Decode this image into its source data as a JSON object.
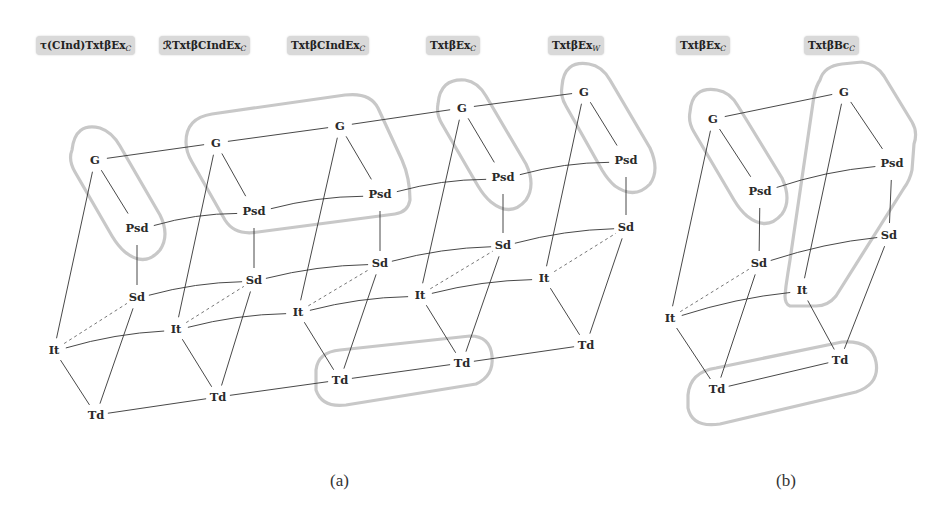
{
  "figure": {
    "column_labels_a": [
      {
        "main": "τ(CInd)TxtβEx",
        "sub": "C",
        "x": 36,
        "y": 36
      },
      {
        "main": "ℛTxtβCIndEx",
        "sub": "C",
        "x": 159,
        "y": 36
      },
      {
        "main": "TxtβCIndEx",
        "sub": "C",
        "x": 287,
        "y": 36
      },
      {
        "main": "TxtβEx",
        "sub": "C",
        "x": 426,
        "y": 36
      },
      {
        "main": "TxtβEx",
        "sub": "W",
        "x": 548,
        "y": 36
      }
    ],
    "column_labels_b": [
      {
        "main": "TxtβEx",
        "sub": "C",
        "x": 676,
        "y": 36
      },
      {
        "main": "TxtβBc",
        "sub": "C",
        "x": 804,
        "y": 36
      }
    ],
    "subfigure_labels": [
      {
        "text": "(a)",
        "x": 330,
        "y": 471
      },
      {
        "text": "(b)",
        "x": 776,
        "y": 471
      }
    ]
  },
  "diagram": {
    "node_label_names": [
      "G",
      "Psd",
      "Sd",
      "It",
      "Td"
    ],
    "nodes": [
      {
        "id": "a1G",
        "label": "G",
        "x": 95,
        "y": 160
      },
      {
        "id": "a1P",
        "label": "Psd",
        "x": 137,
        "y": 228
      },
      {
        "id": "a1S",
        "label": "Sd",
        "x": 137,
        "y": 297
      },
      {
        "id": "a1I",
        "label": "It",
        "x": 54,
        "y": 350
      },
      {
        "id": "a1T",
        "label": "Td",
        "x": 96,
        "y": 415
      },
      {
        "id": "a2G",
        "label": "G",
        "x": 216,
        "y": 143
      },
      {
        "id": "a2P",
        "label": "Psd",
        "x": 254,
        "y": 211
      },
      {
        "id": "a2S",
        "label": "Sd",
        "x": 254,
        "y": 280
      },
      {
        "id": "a2I",
        "label": "It",
        "x": 176,
        "y": 329
      },
      {
        "id": "a2T",
        "label": "Td",
        "x": 218,
        "y": 397
      },
      {
        "id": "a3G",
        "label": "G",
        "x": 340,
        "y": 126
      },
      {
        "id": "a3P",
        "label": "Psd",
        "x": 380,
        "y": 194
      },
      {
        "id": "a3S",
        "label": "Sd",
        "x": 380,
        "y": 263
      },
      {
        "id": "a3I",
        "label": "It",
        "x": 298,
        "y": 312
      },
      {
        "id": "a3T",
        "label": "Td",
        "x": 340,
        "y": 380
      },
      {
        "id": "a4G",
        "label": "G",
        "x": 462,
        "y": 108
      },
      {
        "id": "a4P",
        "label": "Psd",
        "x": 503,
        "y": 177
      },
      {
        "id": "a4S",
        "label": "Sd",
        "x": 503,
        "y": 245
      },
      {
        "id": "a4I",
        "label": "It",
        "x": 420,
        "y": 295
      },
      {
        "id": "a4T",
        "label": "Td",
        "x": 462,
        "y": 363
      },
      {
        "id": "a5G",
        "label": "G",
        "x": 584,
        "y": 92
      },
      {
        "id": "a5P",
        "label": "Psd",
        "x": 626,
        "y": 160
      },
      {
        "id": "a5S",
        "label": "Sd",
        "x": 626,
        "y": 227
      },
      {
        "id": "a5I",
        "label": "It",
        "x": 544,
        "y": 278
      },
      {
        "id": "a5T",
        "label": "Td",
        "x": 586,
        "y": 345
      },
      {
        "id": "b1G",
        "label": "G",
        "x": 713,
        "y": 119
      },
      {
        "id": "b1P",
        "label": "Psd",
        "x": 760,
        "y": 191
      },
      {
        "id": "b1S",
        "label": "Sd",
        "x": 759,
        "y": 263
      },
      {
        "id": "b1I",
        "label": "It",
        "x": 670,
        "y": 318
      },
      {
        "id": "b1T",
        "label": "Td",
        "x": 717,
        "y": 389
      },
      {
        "id": "b2G",
        "label": "G",
        "x": 844,
        "y": 92
      },
      {
        "id": "b2P",
        "label": "Psd",
        "x": 892,
        "y": 163
      },
      {
        "id": "b2S",
        "label": "Sd",
        "x": 889,
        "y": 235
      },
      {
        "id": "b2I",
        "label": "It",
        "x": 802,
        "y": 290
      },
      {
        "id": "b2T",
        "label": "Td",
        "x": 840,
        "y": 360
      }
    ],
    "edges_solid": [
      [
        "a1G",
        "a1P"
      ],
      [
        "a1P",
        "a1S"
      ],
      [
        "a1G",
        "a1I"
      ],
      [
        "a1I",
        "a1T"
      ],
      [
        "a1S",
        "a1T"
      ],
      [
        "a2G",
        "a2P"
      ],
      [
        "a2P",
        "a2S"
      ],
      [
        "a2G",
        "a2I"
      ],
      [
        "a2I",
        "a2T"
      ],
      [
        "a2S",
        "a2T"
      ],
      [
        "a3G",
        "a3P"
      ],
      [
        "a3P",
        "a3S"
      ],
      [
        "a3G",
        "a3I"
      ],
      [
        "a3I",
        "a3T"
      ],
      [
        "a3S",
        "a3T"
      ],
      [
        "a4G",
        "a4P"
      ],
      [
        "a4P",
        "a4S"
      ],
      [
        "a4G",
        "a4I"
      ],
      [
        "a4I",
        "a4T"
      ],
      [
        "a4S",
        "a4T"
      ],
      [
        "a5G",
        "a5P"
      ],
      [
        "a5P",
        "a5S"
      ],
      [
        "a5G",
        "a5I"
      ],
      [
        "a5I",
        "a5T"
      ],
      [
        "a5S",
        "a5T"
      ],
      [
        "b1G",
        "b1P"
      ],
      [
        "b1P",
        "b1S"
      ],
      [
        "b1G",
        "b1I"
      ],
      [
        "b1I",
        "b1T"
      ],
      [
        "b1S",
        "b1T"
      ],
      [
        "b2G",
        "b2P"
      ],
      [
        "b2P",
        "b2S"
      ],
      [
        "b2G",
        "b2I"
      ],
      [
        "b2I",
        "b2T"
      ],
      [
        "b2S",
        "b2T"
      ]
    ],
    "edges_cross": [
      [
        "a1G",
        "a2G"
      ],
      [
        "a2G",
        "a3G"
      ],
      [
        "a3G",
        "a4G"
      ],
      [
        "a4G",
        "a5G"
      ],
      [
        "a1P",
        "a2P"
      ],
      [
        "a2P",
        "a3P"
      ],
      [
        "a3P",
        "a4P"
      ],
      [
        "a4P",
        "a5P"
      ],
      [
        "a1S",
        "a2S"
      ],
      [
        "a2S",
        "a3S"
      ],
      [
        "a3S",
        "a4S"
      ],
      [
        "a4S",
        "a5S"
      ],
      [
        "a1I",
        "a2I"
      ],
      [
        "a2I",
        "a3I"
      ],
      [
        "a3I",
        "a4I"
      ],
      [
        "a4I",
        "a5I"
      ],
      [
        "a1T",
        "a2T"
      ],
      [
        "a2T",
        "a3T"
      ],
      [
        "a3T",
        "a4T"
      ],
      [
        "a4T",
        "a5T"
      ],
      [
        "b1G",
        "b2G"
      ],
      [
        "b1P",
        "b2P"
      ],
      [
        "b1S",
        "b2S"
      ],
      [
        "b1I",
        "b2I"
      ],
      [
        "b1T",
        "b2T"
      ]
    ],
    "edges_dashed": [
      [
        "a1I",
        "a1S"
      ],
      [
        "a2I",
        "a2S"
      ],
      [
        "a3I",
        "a3S"
      ],
      [
        "a4I",
        "a4S"
      ],
      [
        "a5I",
        "a5S"
      ],
      [
        "b1I",
        "b1S"
      ]
    ],
    "groups": [
      {
        "name": "group-a1-G-Psd",
        "path": "M 72 150 Q 75 122 100 128 Q 112 132 120 146 L 160 215 Q 170 235 160 250 Q 145 268 125 252 Q 118 246 112 236 L 75 172 Q 68 160 72 150 Z"
      },
      {
        "name": "group-a2a3-G-Psd",
        "path": "M 186 142 Q 186 118 212 114 L 345 95 Q 370 92 378 108 L 402 160 Q 410 178 410 200 Q 408 212 395 214 L 258 232 Q 235 236 225 220 L 192 162 Q 186 152 186 142 Z"
      },
      {
        "name": "group-a4-G-Psd",
        "path": "M 438 104 Q 440 78 465 80 Q 478 82 486 96 L 526 164 Q 536 185 526 200 Q 511 218 491 202 Q 484 196 478 186 L 442 124 Q 436 114 438 104 Z"
      },
      {
        "name": "group-a5-G-Psd",
        "path": "M 562 86 Q 564 60 589 64 Q 602 66 610 80 L 650 148 Q 660 170 650 184 Q 635 200 615 186 Q 608 180 602 170 L 566 106 Q 560 96 562 86 Z"
      },
      {
        "name": "group-a3a4-Td",
        "path": "M 316 370 Q 318 352 340 350 L 470 336 Q 490 336 492 356 Q 494 376 476 384 L 346 405 Q 322 408 316 390 Z"
      },
      {
        "name": "group-b1-G-Psd",
        "path": "M 690 112 Q 692 86 717 90 Q 730 92 738 106 L 782 178 Q 792 200 782 214 Q 767 232 747 216 Q 740 210 734 200 L 694 132 Q 688 122 690 112 Z"
      },
      {
        "name": "group-b2-G-Psd-Sd-It",
        "path": "M 820 80 Q 824 66 842 64 L 862 62 Q 876 64 884 76 L 912 122 Q 918 132 914 144 L 912 170 Q 910 180 904 188 L 836 296 Q 828 306 816 306 L 790 306 Q 785 304 785 296 L 786 286 Q 788 272 790 260 L 814 96 Q 816 86 820 80 Z"
      },
      {
        "name": "group-b-Td",
        "path": "M 688 395 Q 690 372 716 368 L 842 342 Q 872 340 876 362 Q 880 384 856 392 L 720 424 Q 692 428 688 408 Z"
      }
    ]
  }
}
